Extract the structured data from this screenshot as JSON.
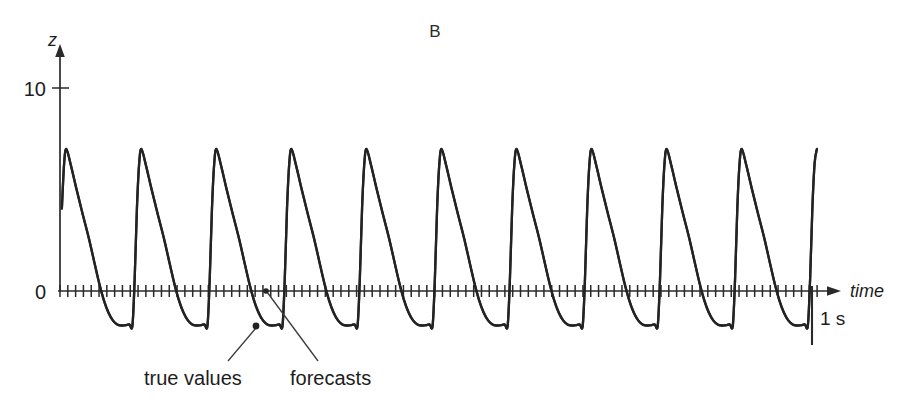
{
  "figure": {
    "panel_label": "B",
    "background_color": "#ffffff",
    "trace_color": "#232323",
    "axis_color": "#2a2a2a"
  },
  "axes": {
    "y_axis_name": "z",
    "x_axis_name": "time",
    "y_tick_labels": [
      "10",
      "0"
    ],
    "y_tick_values": [
      10,
      0
    ]
  },
  "scalebar": {
    "label": "1 s"
  },
  "annotations": [
    {
      "name": "true-values",
      "label": "true values"
    },
    {
      "name": "forecasts",
      "label": "forecasts"
    }
  ],
  "chart_data": {
    "type": "line",
    "title": "B",
    "xlabel": "time",
    "ylabel": "z",
    "grid": false,
    "legend_position": "none",
    "xlim": [
      0,
      10.1
    ],
    "ylim": [
      -2.2,
      11
    ],
    "y_ticks": [
      0,
      10
    ],
    "x_tick_interval_seconds": 0.104,
    "x_axis_unit": "s",
    "scalebar_seconds": 1,
    "period_seconds": 1.0,
    "cycles_shown": 11,
    "peak_value": 7.0,
    "trough_value": -1.7,
    "waveform_description": "Periodic relaxation-oscillator spike train: steep near-vertical rise to a rounded peak near z = 7, followed by a concave decay through zero into a rounded U-shaped trough near z = -1.7, then an abrupt jump back up.",
    "annotations": [
      {
        "text": "true values",
        "points_to": "trough of oscillation (third cycle)"
      },
      {
        "text": "forecasts",
        "points_to": "zero crossing of third cycle"
      }
    ],
    "series": [
      {
        "name": "true values",
        "note": "True trajectory and one-step forecasts overlap almost exactly; the two traces are indistinguishable at this scale.",
        "cycle_profile_time_fraction": [
          0.0,
          0.03,
          0.06,
          0.09,
          0.12,
          0.18,
          0.25,
          0.33,
          0.42,
          0.5,
          0.56,
          0.62,
          0.68,
          0.74,
          0.8,
          0.86,
          0.92,
          0.96,
          1.0
        ],
        "cycle_profile_values": [
          -1.7,
          0.6,
          4.1,
          6.3,
          7.0,
          6.2,
          5.1,
          3.9,
          2.6,
          1.3,
          0.35,
          -0.45,
          -1.05,
          -1.45,
          -1.65,
          -1.7,
          -1.68,
          -1.64,
          -1.7
        ]
      },
      {
        "name": "forecasts",
        "note": "Overlaid on the true-value trace.",
        "cycle_profile_time_fraction": [
          0.0,
          0.03,
          0.06,
          0.09,
          0.12,
          0.18,
          0.25,
          0.33,
          0.42,
          0.5,
          0.56,
          0.62,
          0.68,
          0.74,
          0.8,
          0.86,
          0.92,
          0.96,
          1.0
        ],
        "cycle_profile_values": [
          -1.7,
          0.58,
          4.05,
          6.28,
          6.98,
          6.18,
          5.08,
          3.88,
          2.58,
          1.28,
          0.33,
          -0.47,
          -1.07,
          -1.46,
          -1.66,
          -1.7,
          -1.68,
          -1.64,
          -1.7
        ]
      }
    ],
    "peaks": [
      {
        "cycle": 1,
        "x_seconds": 0.05,
        "value": 6.6
      },
      {
        "cycle": 2,
        "x_seconds": 1.09,
        "value": 7.0
      },
      {
        "cycle": 3,
        "x_seconds": 2.09,
        "value": 7.0
      },
      {
        "cycle": 4,
        "x_seconds": 3.09,
        "value": 7.1
      },
      {
        "cycle": 5,
        "x_seconds": 4.09,
        "value": 7.0
      },
      {
        "cycle": 6,
        "x_seconds": 5.09,
        "value": 7.0
      },
      {
        "cycle": 7,
        "x_seconds": 6.09,
        "value": 7.1
      },
      {
        "cycle": 8,
        "x_seconds": 7.09,
        "value": 7.0
      },
      {
        "cycle": 9,
        "x_seconds": 8.09,
        "value": 7.0
      },
      {
        "cycle": 10,
        "x_seconds": 9.09,
        "value": 7.0
      }
    ],
    "troughs": [
      {
        "cycle": 1,
        "x_seconds": 0.62,
        "value": -1.7
      },
      {
        "cycle": 2,
        "x_seconds": 1.62,
        "value": -1.7
      },
      {
        "cycle": 3,
        "x_seconds": 2.62,
        "value": -1.7
      },
      {
        "cycle": 4,
        "x_seconds": 3.62,
        "value": -1.7
      },
      {
        "cycle": 5,
        "x_seconds": 4.62,
        "value": -1.7
      },
      {
        "cycle": 6,
        "x_seconds": 5.62,
        "value": -1.7
      },
      {
        "cycle": 7,
        "x_seconds": 6.62,
        "value": -1.7
      },
      {
        "cycle": 8,
        "x_seconds": 7.62,
        "value": -1.7
      },
      {
        "cycle": 9,
        "x_seconds": 8.62,
        "value": -1.7
      },
      {
        "cycle": 10,
        "x_seconds": 9.62,
        "value": -1.7
      }
    ]
  }
}
